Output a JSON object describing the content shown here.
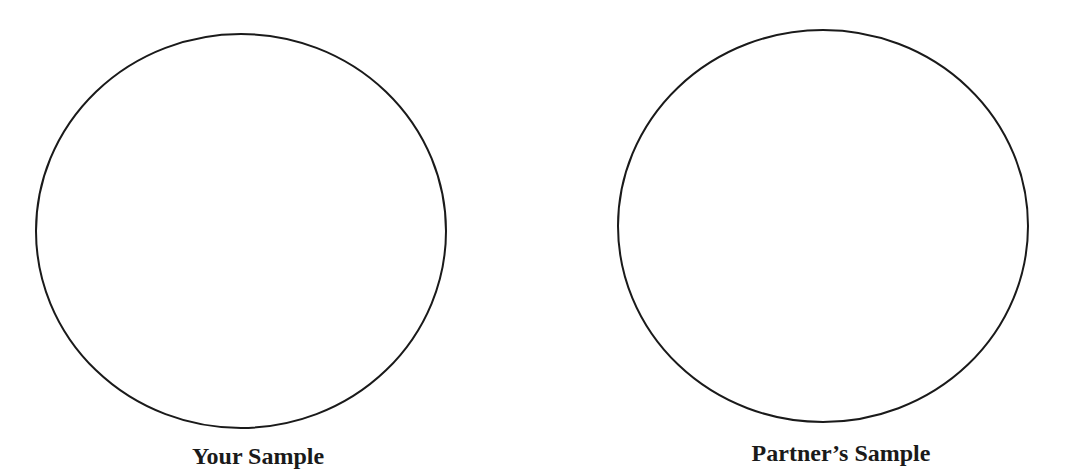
{
  "figure": {
    "samples": [
      {
        "label": "Your Sample",
        "shape": "circle",
        "center": [
          241,
          231
        ],
        "radius_x": 205,
        "radius_y": 197
      },
      {
        "label": "Partner’s Sample",
        "shape": "circle",
        "center": [
          823,
          226
        ],
        "radius_x": 205,
        "radius_y": 196
      }
    ],
    "stroke_color": "#1a1a1a",
    "background_color": "#ffffff"
  }
}
